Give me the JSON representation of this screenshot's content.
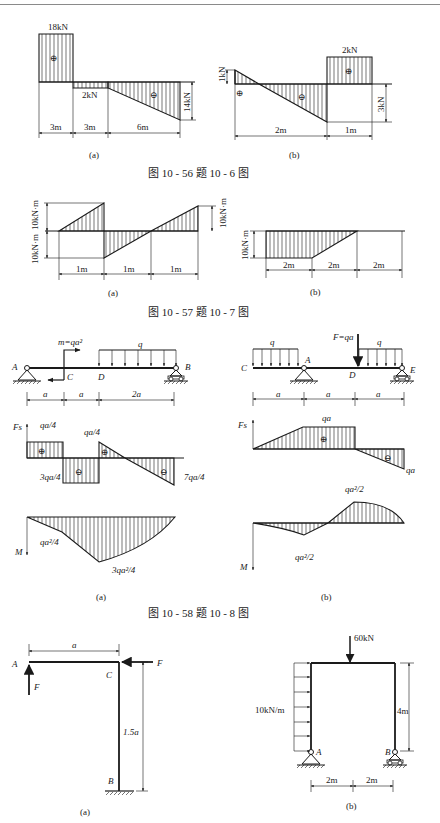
{
  "captions": {
    "fig_10_56": "图 10 - 56   题 10 - 6 图",
    "fig_10_57": "图 10 - 57   题 10 - 7 图",
    "fig_10_58": "图 10 - 58   题 10 - 8 图"
  },
  "sub_labels": {
    "a": "(a)",
    "b": "(b)"
  },
  "fig_10_56": {
    "a": {
      "type": "shear-force-diagram",
      "top_value": "18kN",
      "mid_value": "2kN",
      "right_value": "14kN",
      "signs": [
        "⊕",
        "⊖"
      ],
      "spans": [
        "3m",
        "3m",
        "6m"
      ]
    },
    "b": {
      "type": "shear-force-diagram",
      "left_value": "1kN",
      "right_top_value": "2kN",
      "right_drop_value": "3kN",
      "signs": [
        "⊕",
        "⊖",
        "⊕"
      ],
      "spans": [
        "2m",
        "1m"
      ]
    }
  },
  "fig_10_57": {
    "a": {
      "type": "moment-diagram",
      "top_value": "10kN·m",
      "bottom_value": "10kN·m",
      "right_value": "10kN·m",
      "spans": [
        "1m",
        "1m",
        "1m"
      ]
    },
    "b": {
      "type": "moment-diagram",
      "value": "10kN·m",
      "spans": [
        "2m",
        "2m",
        "2m"
      ]
    }
  },
  "fig_10_58": {
    "a": {
      "beam": {
        "points": [
          "A",
          "C",
          "D",
          "B"
        ],
        "moment_label": "m=qa²",
        "load_label": "q",
        "spans": [
          "a",
          "a",
          "2a"
        ]
      },
      "shear": {
        "axis": "Fs",
        "labels": {
          "left_top": "qa/4",
          "mid_bottom": "3qa/4",
          "mid_top": "qa/4",
          "right_bottom": "7qa/4"
        },
        "signs": [
          "⊕",
          "⊖",
          "⊕",
          "⊖"
        ]
      },
      "moment": {
        "axis": "M",
        "labels": {
          "left": "qa²/4",
          "bottom": "3qa²/4"
        }
      }
    },
    "b": {
      "beam": {
        "points": [
          "C",
          "A",
          "D",
          "E"
        ],
        "force_label": "F=qa",
        "load_label": "q",
        "spans": [
          "a",
          "a",
          "a"
        ]
      },
      "shear": {
        "axis": "Fs",
        "labels": {
          "top": "qa",
          "right_bottom": "qa"
        },
        "signs": [
          "⊕",
          "⊖"
        ]
      },
      "moment": {
        "axis": "M",
        "labels": {
          "top": "qa²/2",
          "bottom": "qa²/2"
        }
      }
    }
  },
  "frames": {
    "a": {
      "points": [
        "A",
        "C",
        "B"
      ],
      "force_label": "F",
      "width_label": "a",
      "height_label": "1.5a"
    },
    "b": {
      "points": [
        "A",
        "B"
      ],
      "point_load": "60kN",
      "distributed_load": "10kN/m",
      "height_label": "4m",
      "spans": [
        "2m",
        "2m"
      ]
    }
  }
}
